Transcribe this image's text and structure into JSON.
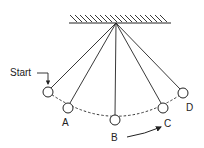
{
  "diagram": {
    "type": "pendulum-swing",
    "labels": {
      "start": "Start",
      "a": "A",
      "b": "B",
      "c": "C",
      "d": "D"
    },
    "pivot": {
      "x": 116,
      "y": 23
    },
    "positions": [
      {
        "id": "start",
        "x": 48,
        "y": 92
      },
      {
        "id": "A",
        "x": 68,
        "y": 108
      },
      {
        "id": "B",
        "x": 115,
        "y": 120
      },
      {
        "id": "C",
        "x": 163,
        "y": 108
      },
      {
        "id": "D",
        "x": 183,
        "y": 93
      }
    ],
    "colors": {
      "stroke": "#222222",
      "background": "#ffffff"
    }
  }
}
